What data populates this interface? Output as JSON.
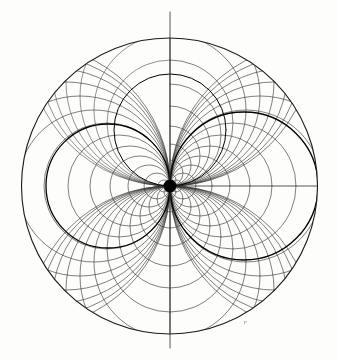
{
  "figure": {
    "kind": "diagram",
    "background_color": "#fdfdfb",
    "line_color": "#2b2b2b",
    "accent_color": "#000000",
    "faint_color": "#9a9a9a",
    "width": 338,
    "height": 360
  },
  "labels": {
    "node_mark": "e",
    "edge_mark": "F"
  },
  "chart_data": {
    "type": "diagram",
    "xlabel": "",
    "ylabel": "",
    "grid": false,
    "legend": "none",
    "outer_circle": {
      "center_x": 169.5,
      "center_y": 186.0,
      "radius": 148.0,
      "stroke": "#1a1a1a",
      "width": 1.1
    },
    "node_point": {
      "x": 170.0,
      "y": 186.0,
      "radius": 6.5,
      "fill": "#000000",
      "description": "common tangency node where all circles of both families meet"
    },
    "axis_lines": [
      {
        "name": "vertical-axis",
        "x1": 170.0,
        "y1": 12.0,
        "x2": 170.0,
        "y2": 348.0,
        "stroke": "#2b2b2b",
        "width": 0.8
      },
      {
        "name": "horizontal-ray",
        "x1": 170.0,
        "y1": 186.0,
        "x2": 318.0,
        "y2": 186.0,
        "stroke": "#2b2b2b",
        "width": 0.8
      }
    ],
    "family_a": {
      "name": "circles tangent to the vertical axis at the node",
      "count": 26,
      "description": "Circles through the node with centers on the horizontal ray; drawn both to the right (full) and to the left (full)",
      "radii_right": [
        6,
        13,
        21,
        30,
        40,
        51,
        63,
        76,
        90,
        104,
        118,
        131,
        142
      ],
      "radii_left": [
        6,
        13,
        21,
        30,
        40,
        51,
        63,
        76,
        90,
        104,
        118,
        131,
        142
      ],
      "stroke": "#3a3a3a",
      "width": 0.65
    },
    "family_b": {
      "name": "circles tangent to the horizontal ray at the node",
      "count": 26,
      "description": "Orthogonal family through the node with centers on the vertical axis; lower arcs full, upper-left arcs suppressed",
      "radii_down": [
        6,
        13,
        21,
        30,
        40,
        51,
        63,
        76,
        90,
        104,
        118,
        131,
        142
      ],
      "radii_up": [
        6,
        13,
        21,
        30,
        40,
        51,
        63,
        76,
        90,
        104,
        118,
        131,
        142
      ],
      "stroke": "#3a3a3a",
      "width": 0.65
    },
    "emphasized_curves": [
      {
        "name": "right-bold-circle",
        "center_x": 244.0,
        "center_y": 186.0,
        "radius": 74.0,
        "stroke": "#000000",
        "width": 1.3
      },
      {
        "name": "left-bold-circle",
        "center_x": 108.0,
        "center_y": 186.0,
        "radius": 62.0,
        "stroke": "#000000",
        "width": 1.3
      },
      {
        "name": "upper-left-bold-arc",
        "center_x": 170.0,
        "center_y": 130.0,
        "radius": 56.0,
        "stroke": "#000000",
        "width": 1.0
      }
    ],
    "blank_sector": {
      "description": "upper-left quadrant left largely white; only the outermost sweeping arcs of family B appear there",
      "angle_start_deg": 90,
      "angle_end_deg": 180
    }
  }
}
